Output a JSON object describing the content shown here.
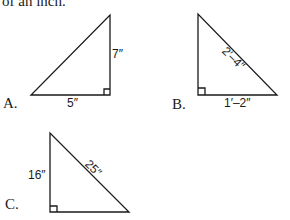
{
  "document": {
    "top_text": "of an inch.",
    "figures": [
      {
        "label": "A.",
        "dimensions": {
          "base": "5″",
          "height": "7″"
        }
      },
      {
        "label": "B.",
        "dimensions": {
          "base": "1′–2″",
          "hypotenuse": "2′–4″"
        }
      },
      {
        "label": "C.",
        "dimensions": {
          "height": "16″",
          "hypotenuse": "25″"
        }
      }
    ]
  }
}
